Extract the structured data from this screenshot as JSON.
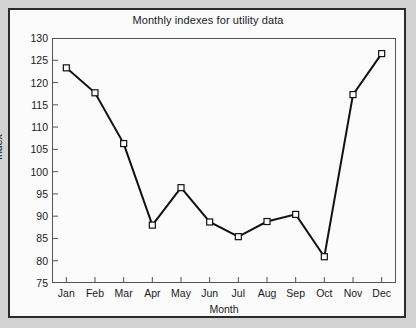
{
  "chart_data": {
    "type": "line",
    "title": "Monthly indexes for utility data",
    "xlabel": "Month",
    "ylabel": "Index",
    "categories": [
      "Jan",
      "Feb",
      "Mar",
      "Apr",
      "May",
      "Jun",
      "Jul",
      "Aug",
      "Sep",
      "Oct",
      "Nov",
      "Dec"
    ],
    "values": [
      123.3,
      117.7,
      106.3,
      88.0,
      96.4,
      88.7,
      85.4,
      88.8,
      90.4,
      80.9,
      117.3,
      126.5
    ],
    "ylim": [
      75,
      130
    ],
    "yticks": [
      75,
      80,
      85,
      90,
      95,
      100,
      105,
      110,
      115,
      120,
      125,
      130
    ],
    "ytick_labels": [
      "75",
      "80",
      "85",
      "90",
      "95",
      "100",
      "105",
      "110",
      "115",
      "120",
      "125",
      "130"
    ],
    "grid": false,
    "legend": null,
    "marker": "open-square",
    "line_color": "#111111",
    "marker_face_color": "#ffffff",
    "marker_edge_color": "#111111",
    "axis_color": "#555555",
    "background_color": "#fbfbfb"
  }
}
